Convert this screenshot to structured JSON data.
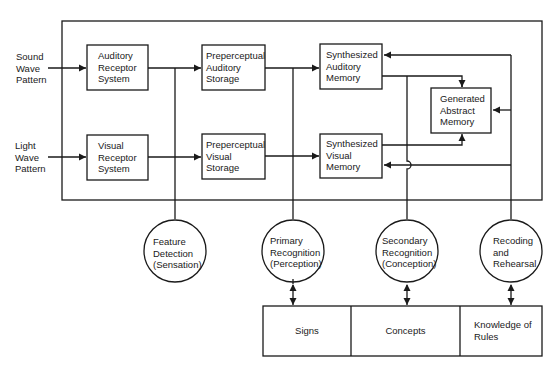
{
  "inputs": [
    {
      "id": "sound",
      "lines": [
        "Sound",
        "Wave",
        "Pattern"
      ]
    },
    {
      "id": "light",
      "lines": [
        "Light",
        "Wave",
        "Pattern"
      ]
    }
  ],
  "boxes": {
    "auditory_receptor": {
      "lines": [
        "Auditory",
        "Receptor",
        "System"
      ]
    },
    "visual_receptor": {
      "lines": [
        "Visual",
        "Receptor",
        "System"
      ]
    },
    "preperceptual_auditory": {
      "lines": [
        "Preperceptual",
        "Auditory",
        "Storage"
      ]
    },
    "preperceptual_visual": {
      "lines": [
        "Preperceptual",
        "Visual",
        "Storage"
      ]
    },
    "synthesized_auditory": {
      "lines": [
        "Synthesized",
        "Auditory",
        "Memory"
      ]
    },
    "synthesized_visual": {
      "lines": [
        "Synthesized",
        "Visual",
        "Memory"
      ]
    },
    "generated_abstract": {
      "lines": [
        "Generated",
        "Abstract",
        "Memory"
      ]
    }
  },
  "processes": {
    "feature_detection": {
      "lines": [
        "Feature",
        "Detection",
        "(Sensation)"
      ]
    },
    "primary_recognition": {
      "lines": [
        "Primary",
        "Recognition",
        "(Perception)"
      ]
    },
    "secondary_recognition": {
      "lines": [
        "Secondary",
        "Recognition",
        "(Conception)"
      ]
    },
    "recoding": {
      "lines": [
        "Recoding",
        "and",
        "Rehearsal"
      ]
    }
  },
  "knowledge": {
    "signs": {
      "lines": [
        "Signs"
      ]
    },
    "concepts": {
      "lines": [
        "Concepts"
      ]
    },
    "rules": {
      "lines": [
        "Knowledge of",
        "Rules"
      ]
    }
  },
  "colors": {
    "stroke": "#1a1a1a",
    "background": "#ffffff"
  }
}
